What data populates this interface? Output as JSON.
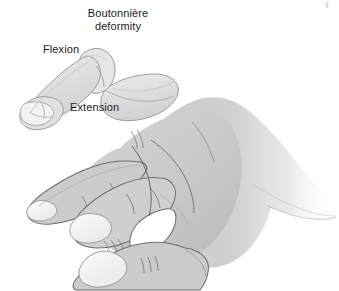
{
  "figure": {
    "kind": "medical-illustration",
    "background_color": "#ffffff",
    "title": {
      "line1": "Boutonnière",
      "line2": "deformity"
    },
    "labels": {
      "flexion": "Flexion",
      "extension": "Extension"
    },
    "colors": {
      "skin_fill": "#c9c9c9",
      "skin_fill_light": "#d8d8d8",
      "skin_shadow": "#b6b6b6",
      "outline": "#6f6f6f",
      "outline_soft": "#8d8d8d",
      "nail_fill": "#f4f4f4",
      "nail_outline": "#9a9a9a",
      "deformed_finger_fill": "#e2e2e2",
      "deformed_finger_outline": "#9c9c9c",
      "text": "#1b1b1b",
      "gap_white": "#ffffff"
    },
    "anatomy": {
      "index_finger": "boutonniere-deformed",
      "pip_joint": "flexed",
      "dip_joint": "hyperextended",
      "visible_digits": [
        "index",
        "middle",
        "ring",
        "thumb"
      ],
      "hand_orientation": "lateral-view-facing-left"
    }
  }
}
